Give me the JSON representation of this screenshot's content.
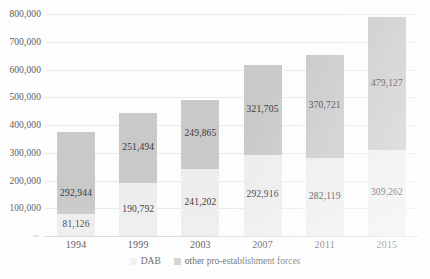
{
  "chart_data": {
    "type": "bar",
    "subtype": "stacked-column",
    "title": "",
    "subtitle": "",
    "xlabel": "",
    "ylabel": "",
    "categories": [
      "1994",
      "1999",
      "2003",
      "2007",
      "2011",
      "2015"
    ],
    "series": [
      {
        "name": "DAB",
        "color": "#ededed",
        "values": [
          81126,
          190792,
          241202,
          292916,
          282119,
          309262
        ],
        "labels": [
          "81,126",
          "190,792",
          "241,202",
          "292,916",
          "282,119",
          "309,262"
        ]
      },
      {
        "name": "other pro-establishment forces",
        "color": "#c9c9c9",
        "values": [
          292944,
          251494,
          249865,
          321705,
          370721,
          479127
        ],
        "labels": [
          "292,944",
          "251,494",
          "249,865",
          "321,705",
          "370,721",
          "479,127"
        ]
      }
    ],
    "totals": [
      374070,
      442286,
      491067,
      614621,
      652840,
      788389
    ],
    "ylim": [
      0,
      800000
    ],
    "ytick_values": [
      0,
      100000,
      200000,
      300000,
      400000,
      500000,
      600000,
      700000,
      800000
    ],
    "ytick_labels": [
      "",
      "100,000",
      "200,000",
      "300,000",
      "400,000",
      "500,000",
      "600,000",
      "700,000",
      "800,000"
    ],
    "grid": true,
    "grid_axis": "y",
    "legend_position": "bottom",
    "legend_entries": [
      "DAB",
      "other pro-establishment forces"
    ]
  },
  "legend": {
    "items": [
      {
        "label": "DAB",
        "color": "#ededed"
      },
      {
        "label": "other pro-establishment forces",
        "color": "#c9c9c9"
      }
    ]
  }
}
